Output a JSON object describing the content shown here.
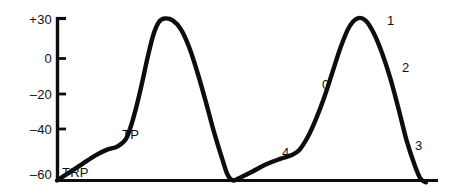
{
  "chart_data": {
    "type": "line",
    "title": "",
    "subtitle": "",
    "xlabel": "",
    "ylabel": "",
    "ylim": [
      -62,
      34
    ],
    "xlim": [
      0,
      100
    ],
    "grid": false,
    "legend": "none",
    "y_ticks": [
      {
        "label": "+30",
        "value": 30
      },
      {
        "label": "0",
        "value": 0
      },
      {
        "label": "–20",
        "value": -20
      },
      {
        "label": "–40",
        "value": -40
      },
      {
        "label": "–60",
        "value": -60
      }
    ],
    "x_ticks": [],
    "series": [
      {
        "name": "Pacemaker action potential",
        "values": [
          {
            "x": 9.0,
            "y": -60
          },
          {
            "x": 13.0,
            "y": -56
          },
          {
            "x": 18.0,
            "y": -51
          },
          {
            "x": 23.0,
            "y": -46
          },
          {
            "x": 27.0,
            "y": -43
          },
          {
            "x": 31.0,
            "y": -41
          },
          {
            "x": 34.0,
            "y": -37
          },
          {
            "x": 36.0,
            "y": -29
          },
          {
            "x": 38.0,
            "y": -18
          },
          {
            "x": 40.0,
            "y": -5
          },
          {
            "x": 42.0,
            "y": 9
          },
          {
            "x": 44.0,
            "y": 21
          },
          {
            "x": 46.0,
            "y": 28
          },
          {
            "x": 48.0,
            "y": 30
          },
          {
            "x": 51.0,
            "y": 29
          },
          {
            "x": 54.0,
            "y": 24
          },
          {
            "x": 57.0,
            "y": 14
          },
          {
            "x": 60.0,
            "y": 0
          },
          {
            "x": 63.0,
            "y": -16
          },
          {
            "x": 66.0,
            "y": -33
          },
          {
            "x": 69.0,
            "y": -48
          },
          {
            "x": 71.0,
            "y": -57
          },
          {
            "x": 73.0,
            "y": -60
          },
          {
            "x": 76.0,
            "y": -58
          },
          {
            "x": 80.0,
            "y": -55
          },
          {
            "x": 85.0,
            "y": -51
          },
          {
            "x": 90.0,
            "y": -48
          },
          {
            "x": 94.0,
            "y": -46
          },
          {
            "x": 97.0,
            "y": -43
          },
          {
            "x": 100.0,
            "y": -36
          },
          {
            "x": 103.0,
            "y": -26
          },
          {
            "x": 106.0,
            "y": -14
          },
          {
            "x": 109.0,
            "y": 0
          },
          {
            "x": 112.0,
            "y": 14
          },
          {
            "x": 115.0,
            "y": 25
          },
          {
            "x": 118.0,
            "y": 30
          },
          {
            "x": 121.0,
            "y": 29
          },
          {
            "x": 124.0,
            "y": 22
          },
          {
            "x": 127.0,
            "y": 11
          },
          {
            "x": 130.0,
            "y": -3
          },
          {
            "x": 133.0,
            "y": -20
          },
          {
            "x": 136.0,
            "y": -38
          },
          {
            "x": 139.0,
            "y": -52
          },
          {
            "x": 141.0,
            "y": -59
          },
          {
            "x": 143.0,
            "y": -61
          }
        ]
      }
    ],
    "annotations": [
      {
        "id": "trp",
        "text": "TRP",
        "meaning": "threshold-potential-baseline-marker",
        "x": 8,
        "y": -57
      },
      {
        "id": "tp",
        "text": "TP",
        "meaning": "threshold-potential",
        "x": 30,
        "y": -40
      },
      {
        "id": "phase4",
        "text": "4",
        "meaning": "phase-4-slow-depolarization",
        "x": 84,
        "y": -46
      },
      {
        "id": "phase0",
        "text": "0",
        "meaning": "phase-0-rapid-depolarization",
        "x": 104,
        "y": -17
      },
      {
        "id": "phase1",
        "text": "1",
        "meaning": "phase-1-early-repolarization",
        "x": 123,
        "y": 28
      },
      {
        "id": "phase2",
        "text": "2",
        "meaning": "phase-2-plateau",
        "x": 131,
        "y": 0
      },
      {
        "id": "phase3",
        "text": "3",
        "meaning": "phase-3-repolarization",
        "x": 140,
        "y": -40
      }
    ],
    "colors": {
      "curve": "#0d0d0d",
      "axis": "#0d0d0d",
      "text": "#111111",
      "background": "#ffffff"
    }
  },
  "axis_labels": {
    "y30": "+30",
    "y0": "0",
    "ym20": "–20",
    "ym40": "–40",
    "ym60": "–60"
  },
  "annotations": {
    "trp": "TRP",
    "tp": "TP",
    "phase4": "4",
    "phase0": "0",
    "phase1": "1",
    "phase2": "2",
    "phase3": "3"
  }
}
